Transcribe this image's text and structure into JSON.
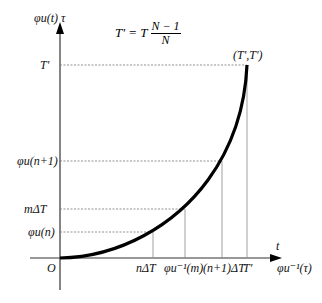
{
  "axes": {
    "y_label": "φu(t)  τ",
    "x_label_top": "t",
    "x_label": "φu⁻¹(τ)",
    "origin": "O"
  },
  "formula": {
    "lhs": "T' = T",
    "numerator": "N − 1",
    "denominator": "N"
  },
  "endpoint_label": "(T',T')",
  "y_ticks": [
    "T'",
    "φu(n+1)",
    "mΔT",
    "φu(n)"
  ],
  "x_ticks": [
    "nΔT",
    "φu⁻¹(m)",
    "(n+1)ΔT",
    "T'"
  ],
  "curve": {
    "description": "convex increasing curve from origin to (T',T')",
    "color": "#000000"
  }
}
